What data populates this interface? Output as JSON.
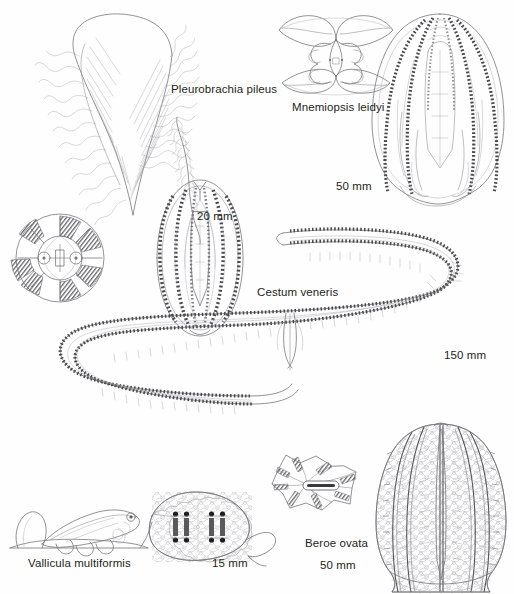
{
  "plate": {
    "background_color": "#fefefe",
    "ink_color": "#231f20",
    "line_color": "#6e6e72",
    "title": "Ctenophora"
  },
  "organisms": [
    {
      "id": "pleurobrachia",
      "name": "Pleurobrachia pileus",
      "scale": "20 mm",
      "views": [
        "aboral-cross-section",
        "lateral-whole-animal-with-tentacles"
      ]
    },
    {
      "id": "mnemiopsis",
      "name": "Mnemiopsis leidyi",
      "scale": "50 mm",
      "views": [
        "oral-lobed-view",
        "lateral-whole-animal"
      ]
    },
    {
      "id": "cestum",
      "name": "Cestum veneris",
      "scale": "150 mm",
      "views": [
        "ribbon-body-s-curve"
      ]
    },
    {
      "id": "vallicula",
      "name": "Vallicula multiformis",
      "scale": "15 mm",
      "views": [
        "lateral-benthic-form",
        "flattened-spread-form"
      ]
    },
    {
      "id": "beroe",
      "name": "Beroe ovata",
      "scale": "50 mm",
      "views": [
        "aboral-star-view",
        "lateral-whole-animal"
      ]
    }
  ],
  "labels": {
    "pleurobrachia_name": "Pleurobrachia pileus",
    "pleurobrachia_scale": "20 mm",
    "mnemiopsis_name": "Mnemiopsis leidyi",
    "mnemiopsis_scale": "50 mm",
    "cestum_name": "Cestum veneris",
    "cestum_scale": "150 mm",
    "vallicula_name": "Vallicula multiformis",
    "vallicula_scale": "15 mm",
    "beroe_name": "Beroe ovata",
    "beroe_scale": "50 mm"
  }
}
